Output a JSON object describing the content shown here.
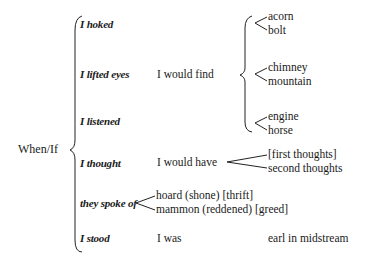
{
  "diagram": {
    "root": "When/If",
    "conditions": [
      {
        "label": "I hoked"
      },
      {
        "label": "I lifted eyes"
      },
      {
        "label": "I listened"
      },
      {
        "label": "I thought"
      },
      {
        "label": "they spoke of"
      },
      {
        "label": "I stood"
      }
    ],
    "consequents": {
      "find": "I would find",
      "have": "I would have",
      "was": "I was"
    },
    "find_options": [
      {
        "top": "acorn",
        "bottom": "bolt"
      },
      {
        "top": "chimney",
        "bottom": "mountain"
      },
      {
        "top": "engine",
        "bottom": "horse"
      }
    ],
    "have_options": {
      "top": "[first thoughts]",
      "bottom": "second thoughts"
    },
    "spoke_options": {
      "top": "hoard (shone) [thrift]",
      "bottom": "mammon (reddened) [greed]"
    },
    "was_result": "earl in midstream"
  }
}
